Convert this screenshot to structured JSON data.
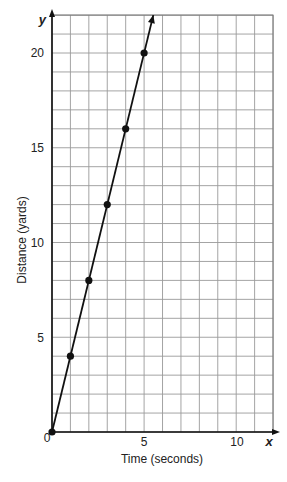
{
  "chart_data": {
    "type": "line",
    "title": "",
    "xlabel": "Time (seconds)",
    "ylabel": "Distance (yards)",
    "x_axis_var": "x",
    "y_axis_var": "y",
    "xlim": [
      0,
      12
    ],
    "ylim": [
      0,
      22
    ],
    "x_ticks": [
      0,
      5,
      10
    ],
    "y_ticks": [
      5,
      10,
      15,
      20
    ],
    "grid": true,
    "grid_step": {
      "x": 1,
      "y": 1
    },
    "series": [
      {
        "name": "distance",
        "x": [
          0,
          1,
          2,
          3,
          4,
          5
        ],
        "values": [
          0,
          4,
          8,
          12,
          16,
          20
        ],
        "markers": true,
        "extends_with_arrow": true
      }
    ],
    "colors": {
      "line": "#111111",
      "grid": "#9a9a9a",
      "axis": "#111111"
    }
  },
  "labels": {
    "origin": "0",
    "x5": "5",
    "x10": "10",
    "y5": "5",
    "y10": "10",
    "y15": "15",
    "y20": "20",
    "x_var": "x",
    "y_var": "y",
    "xlabel": "Time (seconds)",
    "ylabel": "Distance (yards)"
  }
}
